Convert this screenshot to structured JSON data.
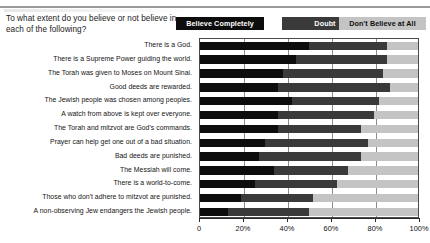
{
  "header": {
    "question": "To what extent do you believe or not believe in each of the following?"
  },
  "legend": {
    "items": [
      {
        "label": "Believe Completely",
        "color": "#0d0d0d"
      },
      {
        "label": "Doubt",
        "color": "#3a3a3a"
      },
      {
        "label": "Don't Believe at All",
        "color": "#c4c4c4"
      }
    ]
  },
  "axis": {
    "ticks": [
      "0",
      "20%",
      "40%",
      "60%",
      "80%",
      "100%"
    ],
    "tick_values": [
      0,
      20,
      40,
      60,
      80,
      100
    ]
  },
  "chart_data": {
    "type": "bar",
    "orientation": "horizontal",
    "stacked": true,
    "title": "To what extent do you believe or not believe in each of the following?",
    "xlabel": "",
    "ylabel": "",
    "xlim": [
      0,
      100
    ],
    "grid": true,
    "legend_position": "top-right",
    "categories": [
      "There is a God.",
      "There is a Supreme Power guiding the world.",
      "The Torah was given to Moses on Mount Sinai.",
      "Good deeds are rewarded.",
      "The Jewish people was chosen among peoples.",
      "A watch from above is kept over everyone.",
      "The Torah and mitzvot are God's commands.",
      "Prayer can help get one out of a bad situation.",
      "Bad deeds are punished.",
      "The Messiah will come.",
      "There is a world-to-come.",
      "Those who don't adhere to mitzvot are punished.",
      "A non-observing Jew endangers the Jewish people."
    ],
    "series": [
      {
        "name": "Believe Completely",
        "color": "#0d0d0d",
        "values": [
          50,
          44,
          38,
          36,
          42,
          36,
          36,
          30,
          27,
          34,
          25,
          19,
          13
        ]
      },
      {
        "name": "Doubt",
        "color": "#3a3a3a",
        "values": [
          36,
          42,
          46,
          51,
          40,
          44,
          38,
          47,
          47,
          34,
          38,
          33,
          37
        ]
      },
      {
        "name": "Don't Believe at All",
        "color": "#c4c4c4",
        "values": [
          14,
          14,
          16,
          13,
          18,
          20,
          26,
          23,
          26,
          32,
          37,
          48,
          50
        ]
      }
    ]
  }
}
